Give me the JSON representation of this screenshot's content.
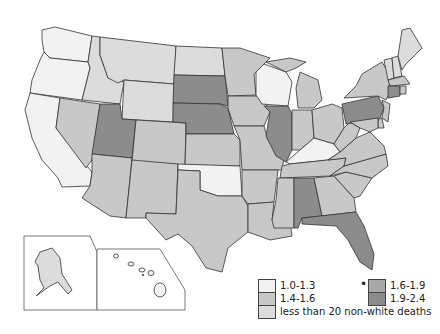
{
  "colors": {
    "c1": "#f2f2f2",
    "c2": "#c8c8c8",
    "c3": "#dcdcdc",
    "c4": "#a8a8a8",
    "c5": "#8c8c8c",
    "border": "#333333"
  },
  "legend": {
    "items": [
      {
        "label": "1.0-1.3",
        "color": "#f2f2f2"
      },
      {
        "label": "1.4-1.6",
        "color": "#c8c8c8"
      },
      {
        "label": "less than 20 non-white deaths",
        "color": "#dcdcdc"
      },
      {
        "label": "1.6-1.9",
        "color": "#a8a8a8"
      },
      {
        "label": "1.9-2.4",
        "color": "#8c8c8c"
      }
    ],
    "marker": "•"
  },
  "states": {
    "WA": "c1",
    "OR": "c1",
    "CA": "c1",
    "ID": "c3",
    "MT": "c3",
    "WY": "c3",
    "NV": "c2",
    "UT": "c5",
    "AZ": "c2",
    "CO": "c2",
    "NM": "c2",
    "ND": "c3",
    "SD": "c5",
    "NE": "c5",
    "KS": "c2",
    "OK": "c1",
    "TX": "c2",
    "MN": "c2",
    "IA": "c2",
    "MO": "c2",
    "AR": "c2",
    "LA": "c2",
    "WI": "c1",
    "IL": "c5",
    "MI": "c2",
    "IN": "c2",
    "OH": "c2",
    "KY": "c1",
    "TN": "c2",
    "MS": "c2",
    "AL": "c5",
    "GA": "c2",
    "FL": "c5",
    "SC": "c2",
    "NC": "c2",
    "VA": "c2",
    "WV": "c2",
    "PA": "c5",
    "NY": "c2",
    "VT": "c3",
    "NH": "c3",
    "ME": "c3",
    "MA": "c2",
    "CT": "c5",
    "RI": "c2",
    "NJ": "c2",
    "DE": "c2",
    "MD": "c2",
    "AK": "c3",
    "HI": "c1"
  }
}
